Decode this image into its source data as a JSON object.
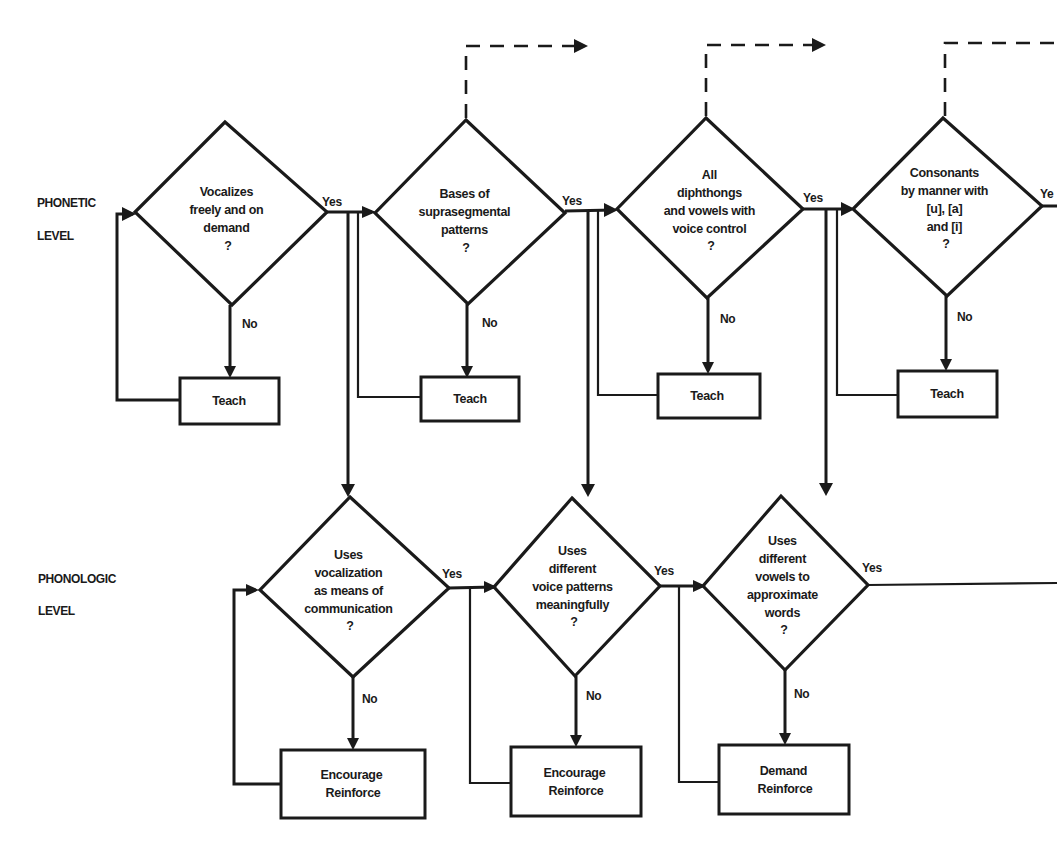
{
  "diagram": {
    "type": "flowchart",
    "levels": [
      {
        "id": "phonetic",
        "line1": "PHONETIC",
        "line2": "LEVEL"
      },
      {
        "id": "phonologic",
        "line1": "PHONOLOGIC",
        "line2": "LEVEL"
      }
    ],
    "edge_labels": {
      "yes": "Yes",
      "yes_truncated": "Ye",
      "no": "No"
    },
    "phonetic_decisions": [
      {
        "id": "d1",
        "lines": [
          "Vocalizes",
          "freely and on",
          "demand",
          "?"
        ]
      },
      {
        "id": "d2",
        "lines": [
          "Bases of",
          "suprasegmental",
          "patterns",
          "?"
        ]
      },
      {
        "id": "d3",
        "lines": [
          "All",
          "diphthongs",
          "and vowels with",
          "voice control",
          "?"
        ]
      },
      {
        "id": "d4",
        "lines": [
          "Consonants",
          "by manner with",
          "[u], [a]",
          "and [i]",
          "?"
        ]
      }
    ],
    "phonetic_actions": [
      {
        "id": "b1",
        "lines": [
          "Teach"
        ]
      },
      {
        "id": "b2",
        "lines": [
          "Teach"
        ]
      },
      {
        "id": "b3",
        "lines": [
          "Teach"
        ]
      },
      {
        "id": "b4",
        "lines": [
          "Teach"
        ]
      }
    ],
    "phonologic_decisions": [
      {
        "id": "d5",
        "lines": [
          "Uses",
          "vocalization",
          "as means of",
          "communication",
          "?"
        ]
      },
      {
        "id": "d6",
        "lines": [
          "Uses",
          "different",
          "voice patterns",
          "meaningfully",
          "?"
        ]
      },
      {
        "id": "d7",
        "lines": [
          "Uses",
          "different",
          "vowels to",
          "approximate",
          "words",
          "?"
        ]
      }
    ],
    "phonologic_actions": [
      {
        "id": "b5",
        "lines": [
          "Encourage",
          "Reinforce"
        ]
      },
      {
        "id": "b6",
        "lines": [
          "Encourage",
          "Reinforce"
        ]
      },
      {
        "id": "b7",
        "lines": [
          "Demand",
          "Reinforce"
        ]
      }
    ],
    "colors": {
      "ink": "#1a1a1a",
      "paper": "#ffffff"
    }
  }
}
